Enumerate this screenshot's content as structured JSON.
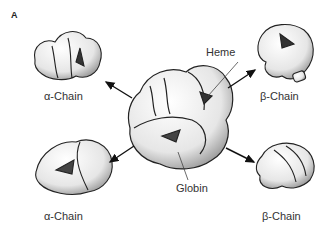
{
  "figure": {
    "panel_label": "A",
    "labels": {
      "alpha_top": "α-Chain",
      "beta_top": "β-Chain",
      "alpha_bottom": "α-Chain",
      "beta_bottom": "β-Chain",
      "heme": "Heme",
      "globin": "Globin"
    },
    "colors": {
      "outline": "#222222",
      "fill": "#f2f2f2",
      "shade": "#9a9a9a",
      "arrow": "#111111"
    }
  }
}
